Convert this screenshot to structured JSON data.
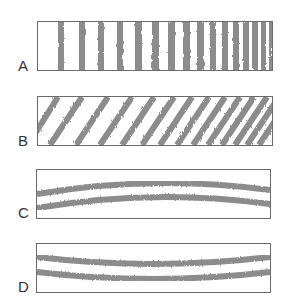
{
  "figure": {
    "panels": [
      {
        "id": "A",
        "label": "A",
        "pattern": "vertical-stripes",
        "stripe_count": 16,
        "description": "vertical fringes, spacing decreases left to right"
      },
      {
        "id": "B",
        "label": "B",
        "pattern": "diagonal-stripes",
        "stripe_count": 14,
        "description": "diagonal fringes, spacing decreases left to right"
      },
      {
        "id": "C",
        "label": "C",
        "pattern": "two-horizontal-bands-arched",
        "band_count": 2,
        "description": "two nearly horizontal bands curving upward in the middle"
      },
      {
        "id": "D",
        "label": "D",
        "pattern": "two-horizontal-bands-sagging",
        "band_count": 2,
        "description": "two nearly horizontal bands curving downward in the middle"
      }
    ],
    "colors": {
      "stripe": "#8a8a8a",
      "border": "#6a6a6a",
      "label": "#333333"
    }
  }
}
